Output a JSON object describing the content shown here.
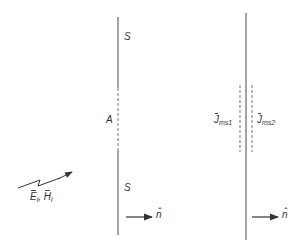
{
  "diagram": {
    "type": "aperture-equivalence",
    "colors": {
      "line": "#555555",
      "text": "#333333",
      "background": "#ffffff"
    },
    "left_screen": {
      "surface_label_top": "S",
      "surface_label_bottom": "S",
      "aperture_label": "A",
      "normal_label": "n̂"
    },
    "right_screen": {
      "current_left_symbol": "J",
      "current_left_sub": "ms1",
      "current_right_symbol": "J",
      "current_right_sub": "ms2",
      "normal_label": "n̂"
    },
    "incident_wave": {
      "e_symbol": "E",
      "e_sub": "i",
      "separator": ",",
      "h_symbol": "H",
      "h_sub": "i"
    }
  }
}
